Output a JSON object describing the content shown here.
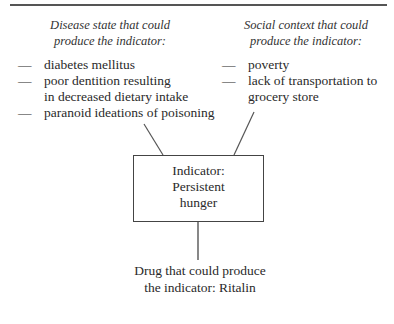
{
  "diagram": {
    "left_panel": {
      "heading_lines": [
        "Disease state that could",
        "produce the indicator:"
      ],
      "items": [
        {
          "dash": "—",
          "lines": [
            "diabetes mellitus"
          ]
        },
        {
          "dash": "—",
          "lines": [
            "poor dentition resulting",
            "in decreased dietary intake"
          ]
        },
        {
          "dash": "—",
          "lines": [
            "paranoid ideations of poisoning"
          ]
        }
      ]
    },
    "right_panel": {
      "heading_lines": [
        "Social context that could",
        "produce the indicator:"
      ],
      "items": [
        {
          "dash": "—",
          "lines": [
            "poverty"
          ]
        },
        {
          "dash": "—",
          "lines": [
            "lack of transportation to",
            "grocery store"
          ]
        }
      ]
    },
    "center_box": {
      "lines": [
        "Indicator:",
        "Persistent",
        "hunger"
      ]
    },
    "bottom_note": {
      "lines": [
        "Drug that could produce",
        "the indicator: Ritalin"
      ]
    },
    "colors": {
      "line": "#555555",
      "text": "#2a2a2a",
      "background": "#ffffff"
    }
  }
}
